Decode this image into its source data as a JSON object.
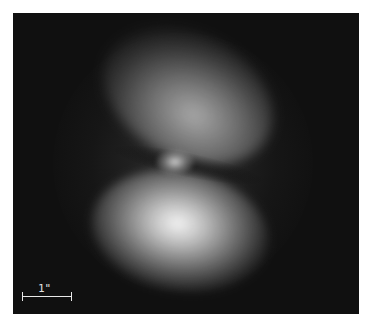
{
  "image": {
    "subject": "bipolar nebula",
    "description": "Grayscale astronomical image of a bipolar nebula with a faint upper lobe, bright lower lobe and a compact central source",
    "background_color": "#101010",
    "scale_bar": {
      "label": "1\"",
      "unit": "arcsecond",
      "color": "#e8e8e8"
    }
  }
}
